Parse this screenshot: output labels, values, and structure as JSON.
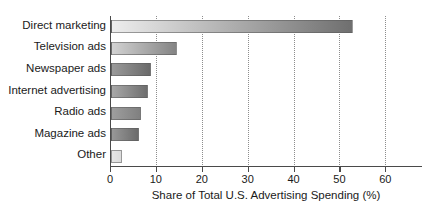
{
  "chart_data": {
    "type": "bar",
    "orientation": "horizontal",
    "title": "",
    "xlabel": "Share of Total U.S. Advertising Spending (%)",
    "ylabel": "",
    "xlim": [
      0,
      68
    ],
    "ylim": null,
    "grid": "vertical-dotted",
    "legend": null,
    "categories": [
      "Direct marketing",
      "Television ads",
      "Newspaper ads",
      "Internet advertising",
      "Radio ads",
      "Magazine ads",
      "Other"
    ],
    "values": [
      52.8,
      14.4,
      8.8,
      8.1,
      6.5,
      6.0,
      2.3
    ],
    "xticks": [
      0,
      10,
      20,
      30,
      40,
      50,
      60
    ],
    "xtick_labels": [
      "0",
      "10",
      "20",
      "30",
      "40",
      "50",
      "60"
    ],
    "bar_colors": [
      {
        "from": "#ededed",
        "to": "#6f6f6f"
      },
      {
        "from": "#d2d2d2",
        "to": "#848484"
      },
      {
        "from": "#9a9a9a",
        "to": "#6a6a6a"
      },
      {
        "from": "#a8a8a8",
        "to": "#6e6e6e"
      },
      {
        "from": "#9e9e9e",
        "to": "#808080"
      },
      {
        "from": "#989898",
        "to": "#6b6b6b"
      },
      {
        "from": "#e6e6e6",
        "to": "#dcdcdc"
      }
    ]
  },
  "colors": {
    "background": "#ffffff",
    "axis": "#4a4a4a",
    "gridline": "#8d8d8d",
    "text": "#1a1a1a"
  }
}
